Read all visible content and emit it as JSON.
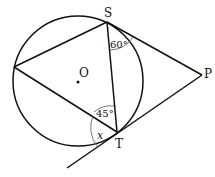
{
  "diagram": {
    "circle": {
      "center": [
        78,
        81
      ],
      "radius": 65,
      "center_label": "O"
    },
    "points": {
      "S": {
        "label": "S",
        "xy": [
          107,
          22
        ]
      },
      "T": {
        "label": "T",
        "xy": [
          117,
          132
        ]
      },
      "P": {
        "label": "P",
        "xy": [
          202,
          75
        ]
      },
      "L": {
        "label": "",
        "xy": [
          14,
          67
        ]
      }
    },
    "angles": {
      "at_S": "60°",
      "at_T": "45°",
      "unknown": "x"
    },
    "segments": [
      "L-S",
      "S-T",
      "L-T",
      "S-P",
      "T-P",
      "tangent-at-T-extended"
    ]
  }
}
